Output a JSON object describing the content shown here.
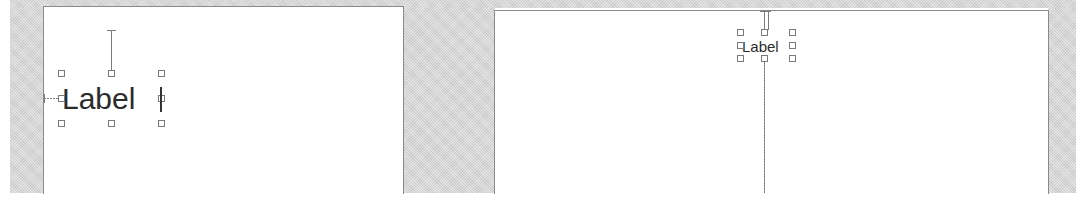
{
  "canvases": [
    {
      "name": "canvas-left",
      "label": {
        "text": "Label",
        "font_size": 28,
        "selected": true
      },
      "constraints": [
        "top",
        "leading"
      ]
    },
    {
      "name": "canvas-right",
      "label": {
        "text": "Label",
        "font_size": 14,
        "selected": true
      },
      "constraints": [
        "top",
        "bottom"
      ]
    }
  ],
  "colors": {
    "background_gray": "#d6d6d6",
    "canvas": "#ffffff",
    "border": "#8a8a8a",
    "handle": "#7a7a7a",
    "text": "#2b2b2b"
  }
}
